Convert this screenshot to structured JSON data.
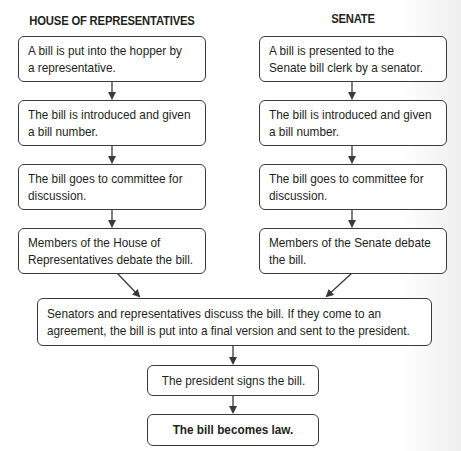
{
  "headers": {
    "house": "HOUSE OF REPRESENTATIVES",
    "senate": "SENATE"
  },
  "house_steps": [
    {
      "line1": "A bill is put into the hopper by",
      "line2": "a representative."
    },
    {
      "line1": "The bill is introduced and given",
      "line2": "a bill number."
    },
    {
      "line1": "The bill goes to committee for",
      "line2": "discussion."
    },
    {
      "line1": "Members of the House of",
      "line2": "Representatives debate the bill."
    }
  ],
  "senate_steps": [
    {
      "line1": "A bill is presented to the",
      "line2": "Senate bill clerk by a senator."
    },
    {
      "line1": "The bill is introduced and given",
      "line2": "a bill number."
    },
    {
      "line1": "The bill goes to committee for",
      "line2": "discussion."
    },
    {
      "line1": "Members of the Senate debate",
      "line2": "the bill."
    }
  ],
  "joint_step": {
    "line1": "Senators and representatives discuss the bill. If they come to an",
    "line2": "agreement, the bill is put into a final version and sent to the president."
  },
  "president_step": "The president signs the bill.",
  "final_step": "The bill becomes law.",
  "colors": {
    "line": "#3a3a3a",
    "text": "#231f20",
    "background": "#ffffff"
  }
}
